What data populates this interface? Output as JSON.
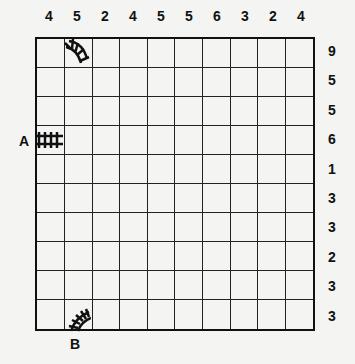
{
  "puzzle": {
    "type": "Train Tracks",
    "grid_size": {
      "rows": 10,
      "cols": 10
    },
    "column_clues": [
      "4",
      "5",
      "2",
      "4",
      "5",
      "5",
      "6",
      "3",
      "2",
      "4"
    ],
    "row_clues": [
      "9",
      "5",
      "5",
      "6",
      "1",
      "3",
      "3",
      "2",
      "3",
      "3"
    ],
    "start_label": "A",
    "end_label": "B",
    "given_tracks": [
      {
        "row": 0,
        "col": 1,
        "shape": "curve"
      },
      {
        "row": 3,
        "col": 0,
        "shape": "straight-horizontal"
      },
      {
        "row": 9,
        "col": 1,
        "shape": "curve"
      }
    ]
  }
}
